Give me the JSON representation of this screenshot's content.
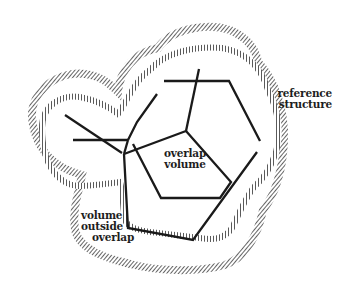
{
  "figure": {
    "labels": {
      "reference_structure": [
        "reference",
        "structure"
      ],
      "overlap_volume": [
        "overlap",
        "volume"
      ],
      "volume_outside_overlap": [
        "volume",
        "outside",
        "overlap"
      ]
    },
    "colors": {
      "line": "#1a1a1a",
      "hatch": "#2a2a2a",
      "background": "#ffffff"
    },
    "legend_semantics": {
      "hatched_outer_contour": "reference structure surface",
      "hatched_inner_contour": "test structure surface",
      "solid_lines": "molecular bond skeletons"
    }
  }
}
